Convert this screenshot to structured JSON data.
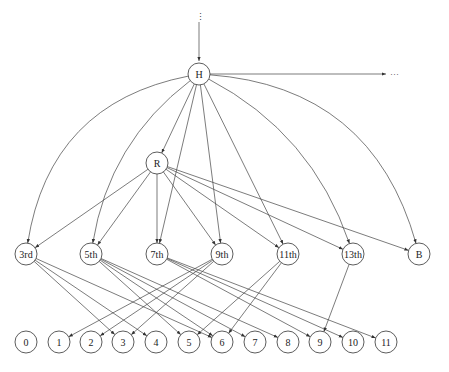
{
  "diagram": {
    "top_ellipsis": "⋮",
    "right_ellipsis": "···",
    "nodes": [
      {
        "id": "H",
        "label": "H",
        "x": 199,
        "y": 74,
        "r": 11
      },
      {
        "id": "R",
        "label": "R",
        "x": 157,
        "y": 163,
        "r": 11
      },
      {
        "id": "n3",
        "label": "3rd",
        "x": 26,
        "y": 254,
        "r": 11
      },
      {
        "id": "n5",
        "label": "5th",
        "x": 91,
        "y": 254,
        "r": 11
      },
      {
        "id": "n7",
        "label": "7th",
        "x": 157,
        "y": 254,
        "r": 11
      },
      {
        "id": "n9",
        "label": "9th",
        "x": 222,
        "y": 254,
        "r": 11
      },
      {
        "id": "n11",
        "label": "11th",
        "x": 288,
        "y": 254,
        "r": 11
      },
      {
        "id": "n13",
        "label": "13th",
        "x": 353,
        "y": 254,
        "r": 11
      },
      {
        "id": "B",
        "label": "B",
        "x": 419,
        "y": 254,
        "r": 11
      },
      {
        "id": "b0",
        "label": "0",
        "x": 26,
        "y": 342,
        "r": 11
      },
      {
        "id": "b1",
        "label": "1",
        "x": 59,
        "y": 342,
        "r": 11
      },
      {
        "id": "b2",
        "label": "2",
        "x": 91,
        "y": 342,
        "r": 11
      },
      {
        "id": "b3",
        "label": "3",
        "x": 123,
        "y": 342,
        "r": 11
      },
      {
        "id": "b4",
        "label": "4",
        "x": 156,
        "y": 342,
        "r": 11
      },
      {
        "id": "b5",
        "label": "5",
        "x": 189,
        "y": 342,
        "r": 11
      },
      {
        "id": "b6",
        "label": "6",
        "x": 222,
        "y": 342,
        "r": 11
      },
      {
        "id": "b7",
        "label": "7",
        "x": 255,
        "y": 342,
        "r": 11
      },
      {
        "id": "b8",
        "label": "8",
        "x": 288,
        "y": 342,
        "r": 11
      },
      {
        "id": "b9",
        "label": "9",
        "x": 320,
        "y": 342,
        "r": 11
      },
      {
        "id": "b10",
        "label": "10",
        "x": 353,
        "y": 342,
        "r": 11
      },
      {
        "id": "b11",
        "label": "11",
        "x": 386,
        "y": 342,
        "r": 11
      }
    ],
    "curved_edges": [
      {
        "from": "H",
        "to": "n3",
        "bend": -0.35
      },
      {
        "from": "H",
        "to": "n5",
        "bend": -0.2
      },
      {
        "from": "H",
        "to": "n13",
        "bend": 0.2
      },
      {
        "from": "H",
        "to": "B",
        "bend": 0.35
      }
    ],
    "straight_edges": [
      {
        "from": "H",
        "to": "R"
      },
      {
        "from": "H",
        "to": "n7"
      },
      {
        "from": "H",
        "to": "n9"
      },
      {
        "from": "H",
        "to": "n11"
      },
      {
        "from": "R",
        "to": "n3"
      },
      {
        "from": "R",
        "to": "n5"
      },
      {
        "from": "R",
        "to": "n7"
      },
      {
        "from": "R",
        "to": "n9"
      },
      {
        "from": "R",
        "to": "n11"
      },
      {
        "from": "R",
        "to": "n13"
      },
      {
        "from": "R",
        "to": "B"
      },
      {
        "from": "n3",
        "to": "b3"
      },
      {
        "from": "n3",
        "to": "b4"
      },
      {
        "from": "n3",
        "to": "b6"
      },
      {
        "from": "n5",
        "to": "b5"
      },
      {
        "from": "n5",
        "to": "b6"
      },
      {
        "from": "n5",
        "to": "b7"
      },
      {
        "from": "n5",
        "to": "b8"
      },
      {
        "from": "n7",
        "to": "b9"
      },
      {
        "from": "n7",
        "to": "b10"
      },
      {
        "from": "n7",
        "to": "b11"
      },
      {
        "from": "n9",
        "to": "b1"
      },
      {
        "from": "n9",
        "to": "b2"
      },
      {
        "from": "n9",
        "to": "b3"
      },
      {
        "from": "n11",
        "to": "b5"
      },
      {
        "from": "n11",
        "to": "b6"
      },
      {
        "from": "n13",
        "to": "b9"
      }
    ]
  }
}
